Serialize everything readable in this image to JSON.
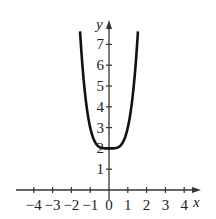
{
  "chart_data": {
    "type": "line",
    "title": "",
    "xlabel": "x",
    "ylabel": "y",
    "xlim": [
      -4.5,
      4.6
    ],
    "ylim": [
      0,
      7.8
    ],
    "x_ticks": [
      "-4",
      "-3",
      "-2",
      "-1",
      "0",
      "1",
      "2",
      "3",
      "4"
    ],
    "y_ticks": [
      "1",
      "2",
      "3",
      "4",
      "5",
      "6",
      "7"
    ],
    "grid": false,
    "legend": null,
    "series": [
      {
        "name": "y = x^4 + 2",
        "x": [
          -1.55,
          -1.5,
          -1.25,
          -1.0,
          -0.75,
          -0.5,
          -0.25,
          0,
          0.25,
          0.5,
          0.75,
          1.0,
          1.25,
          1.5,
          1.55
        ],
        "y": [
          7.77,
          7.06,
          4.44,
          3.0,
          2.32,
          2.06,
          2.0,
          2.0,
          2.0,
          2.06,
          2.32,
          3.0,
          4.44,
          7.06,
          7.77
        ]
      }
    ]
  },
  "axes": {
    "x_label": "x",
    "y_label": "y"
  }
}
